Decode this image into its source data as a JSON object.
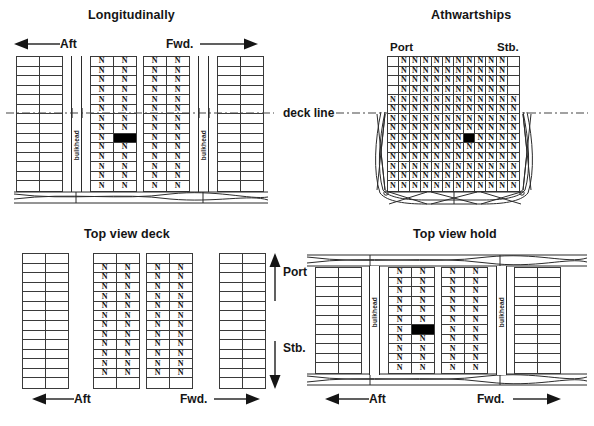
{
  "figure": {
    "kind": "ship-stowage-diagram",
    "colors": {
      "line": "#2b2b2b",
      "grid": "#3a3a3a",
      "filled_cell": "#000000",
      "text": "#151515",
      "background": "#ffffff"
    }
  },
  "panels": {
    "longitudinally": {
      "title": "Longitudinally",
      "aft_label": "Aft",
      "fwd_label": "Fwd.",
      "bulkhead_label_aft": "bulkhead",
      "bulkhead_label_fwd": "bulkhead",
      "blocks": [
        {
          "name": "aft-hold-empty",
          "cols": 2,
          "rows": 14,
          "marks": []
        },
        {
          "name": "aft-center-n",
          "cols": 2,
          "rows": 14,
          "marks": [
            "N"
          ],
          "filled_cell": {
            "row": 9,
            "col": 2
          }
        },
        {
          "name": "fwd-center-n",
          "cols": 2,
          "rows": 14,
          "marks": [
            "N"
          ]
        },
        {
          "name": "fwd-hold-empty",
          "cols": 2,
          "rows": 14,
          "marks": []
        }
      ]
    },
    "athwartships": {
      "title": "Athwartships",
      "port_label": "Port",
      "stb_label": "Stb.",
      "grid": {
        "cols": 12,
        "rows": 14,
        "mark": "N",
        "filled_cell": {
          "row": 9,
          "col": 8
        }
      },
      "empty_corner_cols": {
        "left": 1,
        "right": 1,
        "rows": 4
      }
    },
    "deck_line": {
      "label": "deck line"
    },
    "top_view_deck": {
      "title": "Top view deck",
      "aft_label": "Aft",
      "fwd_label": "Fwd.",
      "port_label": "Port",
      "stb_label": "Stb.",
      "blocks": [
        {
          "name": "aft-deck-empty",
          "cols": 2,
          "rows": 14,
          "marks": []
        },
        {
          "name": "aft-deck-n",
          "cols": 2,
          "rows": 14,
          "marks": [
            "N"
          ],
          "blank_rows": [
            1,
            14
          ]
        },
        {
          "name": "fwd-deck-n",
          "cols": 2,
          "rows": 14,
          "marks": [
            "N"
          ],
          "blank_rows": [
            1,
            14
          ]
        },
        {
          "name": "fwd-deck-empty",
          "cols": 2,
          "rows": 14,
          "marks": []
        }
      ]
    },
    "top_view_hold": {
      "title": "Top view hold",
      "aft_label": "Aft",
      "fwd_label": "Fwd.",
      "bulkhead_label_aft": "bulkhead",
      "bulkhead_label_fwd": "bulkhead",
      "blocks": [
        {
          "name": "aft-hold-empty",
          "cols": 2,
          "rows": 11,
          "marks": []
        },
        {
          "name": "aft-hold-n",
          "cols": 2,
          "rows": 11,
          "marks": [
            "N"
          ],
          "filled_cell": {
            "row": 7,
            "col": 2
          }
        },
        {
          "name": "fwd-hold-n",
          "cols": 2,
          "rows": 11,
          "marks": [
            "N"
          ]
        },
        {
          "name": "fwd-hold-empty",
          "cols": 2,
          "rows": 11,
          "marks": []
        }
      ]
    }
  },
  "glyphs": {
    "container_mark": "N",
    "arrow_left": "◀",
    "arrow_right": "▶",
    "arrow_up": "▲",
    "arrow_down": "▼"
  }
}
